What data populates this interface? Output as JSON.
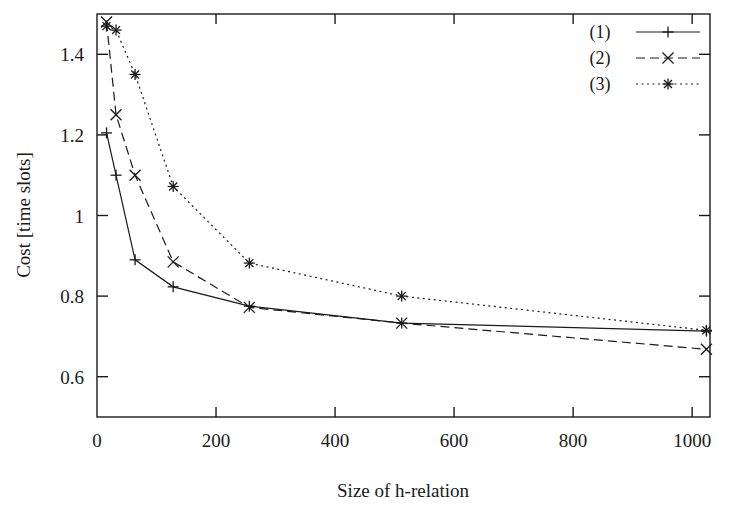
{
  "chart_data": {
    "type": "line",
    "title": "",
    "xlabel": "Size of h-relation",
    "ylabel": "Cost [time slots]",
    "xlim": [
      0,
      1030
    ],
    "ylim": [
      0.5,
      1.5
    ],
    "grid": false,
    "legend_position": "top-right",
    "xticks": [
      0,
      200,
      400,
      600,
      800,
      1000
    ],
    "xticklabels": [
      "0",
      "200",
      "400",
      "600",
      "800",
      "1000"
    ],
    "yticks": [
      0.6,
      0.8,
      1,
      1.2,
      1.4
    ],
    "yticklabels": [
      "0.6",
      "0.8",
      "1",
      "1.2",
      "1.4"
    ],
    "x": [
      16,
      32,
      64,
      128,
      256,
      512,
      1024
    ],
    "series": [
      {
        "name": "(1)",
        "label": "(1)",
        "linestyle": "solid",
        "marker": "plus",
        "color": "#1a1a1a",
        "values": [
          1.205,
          1.1,
          0.89,
          0.823,
          0.775,
          0.733,
          0.713
        ]
      },
      {
        "name": "(2)",
        "label": "(2)",
        "linestyle": "dashed",
        "marker": "cross",
        "color": "#1a1a1a",
        "values": [
          1.48,
          1.25,
          1.1,
          0.885,
          0.772,
          0.733,
          0.668
        ]
      },
      {
        "name": "(3)",
        "label": "(3)",
        "linestyle": "dotted",
        "marker": "star",
        "color": "#1a1a1a",
        "values": [
          1.47,
          1.46,
          1.35,
          1.072,
          0.882,
          0.8,
          0.715
        ]
      }
    ]
  },
  "axes": {
    "y_label": "Cost [time slots]",
    "x_label": "Size of h-relation"
  },
  "legend": {
    "entries": [
      {
        "label": "(1)"
      },
      {
        "label": "(2)"
      },
      {
        "label": "(3)"
      }
    ]
  },
  "colors": {
    "ink": "#1a1a1a",
    "background": "#ffffff"
  }
}
